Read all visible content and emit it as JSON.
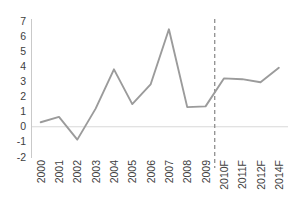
{
  "chart_data": {
    "type": "line",
    "title": "",
    "subtitle": "",
    "xlabel": "",
    "ylabel": "",
    "categories": [
      "2000",
      "2001",
      "2002",
      "2003",
      "2004",
      "2005",
      "2006",
      "2007",
      "2008",
      "2009",
      "2010F",
      "2011F",
      "2012F",
      "2014F"
    ],
    "values": [
      0.3,
      0.65,
      -0.85,
      1.2,
      3.8,
      1.5,
      2.8,
      6.45,
      1.3,
      1.35,
      3.2,
      3.15,
      2.95,
      3.9
    ],
    "series": [
      {
        "name": "",
        "values": [
          0.3,
          0.65,
          -0.85,
          1.2,
          3.8,
          1.5,
          2.8,
          6.45,
          1.3,
          1.35,
          3.2,
          3.15,
          2.95,
          3.9
        ]
      }
    ],
    "yticks": [
      7,
      6,
      5,
      4,
      3,
      2,
      1,
      0,
      -1,
      -2
    ],
    "ytick_labels": [
      "7",
      "6",
      "5",
      "4",
      "3",
      "2",
      "1",
      "0",
      "-1",
      "-2"
    ],
    "ylim": [
      -2,
      7
    ],
    "grid": false,
    "zero_line": true,
    "legend": "none",
    "annotations": [
      {
        "name": "forecast-divider",
        "type": "vertical-dashed-line",
        "between": [
          "2009",
          "2010F"
        ]
      }
    ],
    "colors": {
      "line": "#9b9b9b",
      "axis": "#c9c9c9",
      "zero_line": "#d8d8d8",
      "divider": "#8f8f8f",
      "text": "#404040",
      "background": "#ffffff"
    }
  }
}
